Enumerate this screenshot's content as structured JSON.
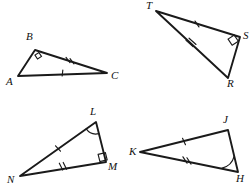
{
  "figure": {
    "kind": "geometry-diagram",
    "width": 250,
    "height": 191,
    "stroke_color": "#1a1a1a",
    "background_color": "#ffffff"
  },
  "triangles": [
    {
      "id": "ABC",
      "name": "triangle-abc",
      "vertices": [
        {
          "label": "A",
          "x": 18,
          "y": 76,
          "label_x": 6,
          "label_y": 76
        },
        {
          "label": "B",
          "x": 35,
          "y": 50,
          "label_x": 26,
          "label_y": 31
        },
        {
          "label": "C",
          "x": 107,
          "y": 73,
          "label_x": 111,
          "label_y": 70
        }
      ],
      "right_angle_at": "B",
      "marks": [
        {
          "edge": "AC",
          "ticks": 1
        },
        {
          "edge": "BC",
          "ticks": 2
        }
      ]
    },
    {
      "id": "TSR",
      "name": "triangle-tsr",
      "vertices": [
        {
          "label": "T",
          "x": 156,
          "y": 11,
          "label_x": 146,
          "label_y": 0
        },
        {
          "label": "S",
          "x": 240,
          "y": 37,
          "label_x": 243,
          "label_y": 30
        },
        {
          "label": "R",
          "x": 228,
          "y": 78,
          "label_x": 227,
          "label_y": 78
        }
      ],
      "right_angle_at": "S",
      "marks": [
        {
          "edge": "TS",
          "ticks": 1
        },
        {
          "edge": "TR",
          "ticks": 2
        }
      ]
    },
    {
      "id": "NLM",
      "name": "triangle-nlm",
      "vertices": [
        {
          "label": "N",
          "x": 20,
          "y": 176,
          "label_x": 7,
          "label_y": 174
        },
        {
          "label": "L",
          "x": 96,
          "y": 122,
          "label_x": 90,
          "label_y": 106
        },
        {
          "label": "M",
          "x": 106,
          "y": 162,
          "label_x": 108,
          "label_y": 161
        }
      ],
      "right_angle_at": "M",
      "angle_arc_at": "L",
      "marks": [
        {
          "edge": "NL",
          "ticks": 1
        },
        {
          "edge": "NM",
          "ticks": 2
        }
      ]
    },
    {
      "id": "KJH",
      "name": "triangle-kjh",
      "vertices": [
        {
          "label": "K",
          "x": 140,
          "y": 152,
          "label_x": 129,
          "label_y": 146
        },
        {
          "label": "J",
          "x": 228,
          "y": 130,
          "label_x": 223,
          "label_y": 114
        },
        {
          "label": "H",
          "x": 238,
          "y": 172,
          "label_x": 236,
          "label_y": 173
        }
      ],
      "angle_arc_at": "H",
      "marks": [
        {
          "edge": "KJ",
          "ticks": 1
        },
        {
          "edge": "KH",
          "ticks": 2
        }
      ]
    }
  ]
}
